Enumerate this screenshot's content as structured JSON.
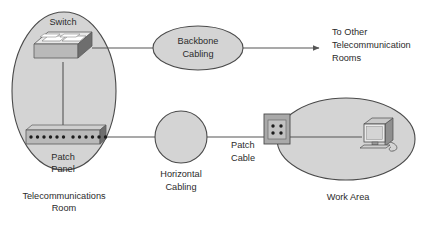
{
  "diagram": {
    "background_color": "#ffffff",
    "shape_fill": "#d4d4d4",
    "shape_stroke": "#4a4a4a",
    "line_color": "#555555",
    "text_color": "#2b2b2b",
    "zones": [
      {
        "id": "telecom-room",
        "shape": "ellipse",
        "label_line1": "Telecommunications",
        "label_line2": "Room",
        "cx": 64,
        "cy": 91,
        "rx": 52,
        "ry": 79
      },
      {
        "id": "work-area",
        "shape": "ellipse",
        "label_line1": "Work Area",
        "cx": 346,
        "cy": 139,
        "rx": 69,
        "ry": 41
      }
    ],
    "cabling_nodes": [
      {
        "id": "backbone-cabling",
        "shape": "ellipse",
        "label_line1": "Backbone",
        "label_line2": "Cabling",
        "cx": 198,
        "cy": 48,
        "rx": 45,
        "ry": 22
      },
      {
        "id": "horizontal-cabling",
        "shape": "circle",
        "label_line1": "Horizontal",
        "label_line2": "Cabling",
        "cx": 181,
        "cy": 137,
        "rx": 26,
        "ry": 26
      }
    ],
    "devices": [
      {
        "id": "switch",
        "label": "Switch",
        "port_rows": 2
      },
      {
        "id": "patch-panel",
        "label_line1": "Patch",
        "label_line2": "Panel",
        "port_groups": 2,
        "ports_per_group": 6,
        "total_ports": 12
      },
      {
        "id": "wall-outlet",
        "label_line1": "Patch",
        "label_line2": "Cable",
        "jack_count": 4
      },
      {
        "id": "workstation",
        "label": "Computer"
      }
    ],
    "annotations": [
      {
        "id": "to-other-rooms",
        "line1": "To Other",
        "line2": "Telecommunication",
        "line3": "Rooms"
      }
    ]
  }
}
